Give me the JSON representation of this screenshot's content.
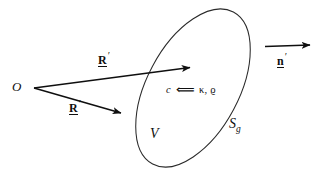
{
  "figure": {
    "name": "material-body-vector-diagram",
    "background_color": "#ffffff",
    "ink_color": "#0f0f0f",
    "labels": {
      "origin": "O",
      "position_vector_upper_letter": "R",
      "position_vector_upper_prime": "′",
      "position_vector_lower_letter": "R",
      "position_vector_lower_prime": "′",
      "normal_letter": "n",
      "normal_prime": "′",
      "volume": "V",
      "surface_letter": "S",
      "surface_subscript": "g",
      "constitutive_c": "c",
      "constitutive_arrow": "⟸",
      "constitutive_params": "κ, ϱ"
    }
  },
  "geometry": {
    "ellipse": {
      "center_x": 193,
      "center_y": 88,
      "radius_x": 46,
      "radius_y": 86,
      "rotation_deg": 28
    },
    "origin_point": {
      "x": 33,
      "y": 88
    },
    "arrow_upper_tip": {
      "x": 192,
      "y": 67
    },
    "arrow_lower_tip": {
      "x": 123,
      "y": 114
    },
    "normal_arrow_start": {
      "x": 265,
      "y": 47
    },
    "normal_arrow_tip": {
      "x": 312,
      "y": 45
    }
  }
}
